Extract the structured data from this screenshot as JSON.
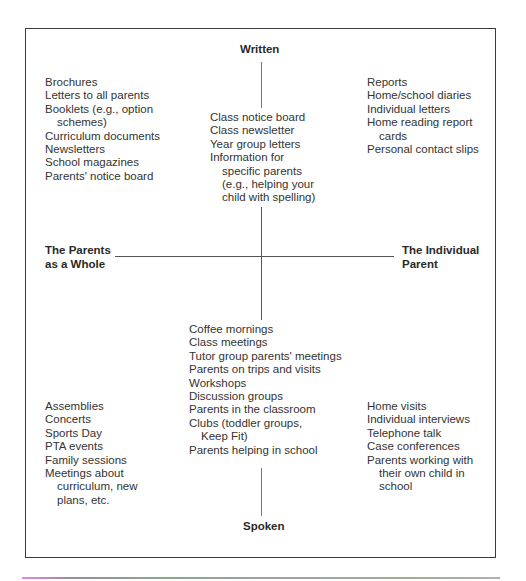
{
  "diagram": {
    "poles": {
      "top": "Written",
      "bottom": "Spoken",
      "left": [
        "The Parents",
        "as a Whole"
      ],
      "right": [
        "The Individual",
        "Parent"
      ]
    },
    "quadrants": {
      "written_whole": [
        [
          "Brochures"
        ],
        [
          "Letters to all parents"
        ],
        [
          "Booklets (e.g., option",
          "schemes)"
        ],
        [
          "Curriculum documents"
        ],
        [
          "Newsletters"
        ],
        [
          "School magazines"
        ],
        [
          "Parents' notice board"
        ]
      ],
      "written_center": [
        [
          "Class notice board"
        ],
        [
          "Class newsletter"
        ],
        [
          "Year group letters"
        ],
        [
          "Information for",
          "specific parents",
          "(e.g., helping your",
          "child with spelling)"
        ]
      ],
      "written_individual": [
        [
          "Reports"
        ],
        [
          "Home/school diaries"
        ],
        [
          "Individual letters"
        ],
        [
          "Home reading report",
          "cards"
        ],
        [
          "Personal contact slips"
        ]
      ],
      "spoken_center": [
        [
          "Coffee mornings"
        ],
        [
          "Class meetings"
        ],
        [
          "Tutor group parents' meetings"
        ],
        [
          "Parents on trips and visits"
        ],
        [
          "Workshops"
        ],
        [
          "Discussion groups"
        ],
        [
          "Parents in the classroom"
        ],
        [
          "Clubs (toddler groups,",
          "Keep Fit)"
        ],
        [
          "Parents helping in school"
        ]
      ],
      "spoken_whole": [
        [
          "Assemblies"
        ],
        [
          "Concerts"
        ],
        [
          "Sports Day"
        ],
        [
          "PTA events"
        ],
        [
          "Family sessions"
        ],
        [
          "Meetings about",
          "curriculum, new",
          "plans, etc."
        ]
      ],
      "spoken_individual": [
        [
          "Home visits"
        ],
        [
          "Individual interviews"
        ],
        [
          "Telephone talk"
        ],
        [
          "Case conferences"
        ],
        [
          "Parents working with",
          "their own child in",
          "school"
        ]
      ]
    }
  }
}
